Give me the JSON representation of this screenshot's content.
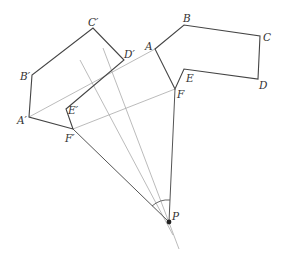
{
  "diagram": {
    "type": "rotation-construction",
    "original_polygon": {
      "name": "ABCDEF",
      "vertices": {
        "A": [
          155,
          49
        ],
        "B": [
          184,
          25
        ],
        "C": [
          260,
          36
        ],
        "D": [
          258,
          79
        ],
        "E": [
          184,
          69
        ],
        "F": [
          175,
          89
        ]
      }
    },
    "image_polygon": {
      "name": "A'B'C'D'E'F'",
      "vertices": {
        "A'": [
          29,
          117
        ],
        "B'": [
          32,
          75
        ],
        "C'": [
          93,
          28
        ],
        "D'": [
          124,
          60
        ],
        "E'": [
          66,
          109
        ],
        "F'": [
          73,
          129
        ]
      }
    },
    "center": {
      "name": "P",
      "point": [
        169,
        222
      ]
    },
    "labels": {
      "A": "A",
      "B": "B",
      "C": "C",
      "D": "D",
      "E": "E",
      "F": "F",
      "A_prime": "A′",
      "B_prime": "B′",
      "C_prime": "C′",
      "D_prime": "D′",
      "E_prime": "E′",
      "F_prime": "F′",
      "P": "P"
    },
    "segments_dotted": [
      "AA'",
      "FF'"
    ],
    "rays_from_P": [
      "PF",
      "PF'"
    ],
    "perpendicular_bisectors": 2,
    "angle_marker": "angle F'PF"
  }
}
